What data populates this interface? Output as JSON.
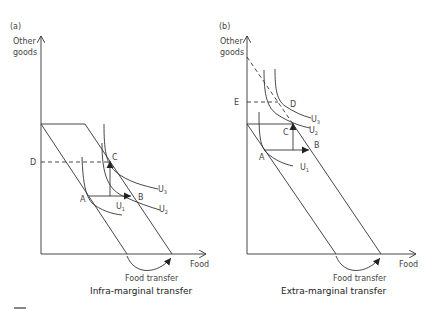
{
  "panels": [
    {
      "id": "a",
      "panel_label": "(a)",
      "y_axis_label_line1": "Other",
      "y_axis_label_line2": "goods",
      "x_axis_label": "Food",
      "transfer_label": "Food transfer",
      "title": "Infra-marginal transfer",
      "points": {
        "A": "A",
        "B": "B",
        "C": "C",
        "D": "D"
      },
      "curves": {
        "U1": "U",
        "U1_sub": "1",
        "U2": "U",
        "U2_sub": "2",
        "U3": "U",
        "U3_sub": "3"
      }
    },
    {
      "id": "b",
      "panel_label": "(b)",
      "y_axis_label_line1": "Other",
      "y_axis_label_line2": "goods",
      "x_axis_label": "Food",
      "transfer_label": "Food transfer",
      "title": "Extra-marginal transfer",
      "points": {
        "A": "A",
        "B": "B",
        "C": "C",
        "D": "D",
        "E": "E"
      },
      "curves": {
        "U1": "U",
        "U1_sub": "1",
        "U2": "U",
        "U2_sub": "2",
        "U3": "U",
        "U3_sub": "3"
      }
    }
  ],
  "colors": {
    "line": "#333333",
    "text": "#444444",
    "background": "#ffffff"
  }
}
